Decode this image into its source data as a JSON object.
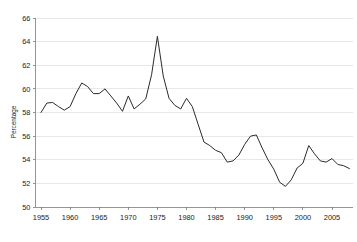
{
  "chart_data": {
    "type": "line",
    "title": "",
    "subtitle": "",
    "xlabel": "",
    "ylabel": "Percentage",
    "xlim": [
      1954.0,
      2008.6
    ],
    "ylim": [
      50,
      66
    ],
    "ytick_step": 2,
    "xtick_step": 5,
    "grid": true,
    "grid_axis": "y",
    "legend": false,
    "legend_position": "none",
    "line_color": "#2b2b2b",
    "grid_color": "#d9d9d9",
    "axis_color": "#7a7a7a",
    "yticks": [
      50,
      52,
      54,
      56,
      58,
      60,
      62,
      64,
      66
    ],
    "ytick_labels": [
      "50",
      "52",
      "54",
      "56",
      "58",
      "60",
      "62",
      "64",
      "66"
    ],
    "xticks": [
      1955,
      1960,
      1965,
      1970,
      1975,
      1980,
      1985,
      1990,
      1995,
      2000,
      2005
    ],
    "xtick_labels": [
      "1955",
      "1960",
      "1965",
      "1970",
      "1975",
      "1980",
      "1985",
      "1990",
      "1995",
      "2000",
      "2005"
    ],
    "series": [
      {
        "name": "Percentage",
        "x": [
          1955,
          1956,
          1957,
          1958,
          1959,
          1960,
          1961,
          1962,
          1963,
          1964,
          1965,
          1966,
          1967,
          1968,
          1969,
          1970,
          1971,
          1972,
          1973,
          1974,
          1975,
          1976,
          1977,
          1978,
          1979,
          1980,
          1981,
          1982,
          1983,
          1984,
          1985,
          1986,
          1987,
          1988,
          1989,
          1990,
          1991,
          1992,
          1993,
          1994,
          1995,
          1996,
          1997,
          1998,
          1999,
          2000,
          2001,
          2002,
          2003,
          2004,
          2005,
          2006,
          2007,
          2008
        ],
        "values": [
          58.0,
          58.8,
          58.85,
          58.5,
          58.2,
          58.5,
          59.6,
          60.5,
          60.2,
          59.6,
          59.6,
          60.0,
          59.4,
          58.8,
          58.1,
          59.4,
          58.3,
          58.7,
          59.15,
          61.2,
          64.45,
          61.1,
          59.2,
          58.6,
          58.3,
          59.2,
          58.5,
          57.0,
          55.5,
          55.2,
          54.8,
          54.6,
          53.8,
          53.9,
          54.4,
          55.3,
          56.0,
          56.1,
          55.0,
          54.0,
          53.2,
          52.1,
          51.75,
          52.3,
          53.3,
          53.7,
          55.2,
          54.5,
          53.9,
          53.8,
          54.1,
          53.6,
          53.5,
          53.25
        ]
      }
    ],
    "data_min": {
      "year": 1997,
      "value": 51.75
    },
    "data_max": {
      "year": 1975,
      "value": 64.45
    }
  }
}
